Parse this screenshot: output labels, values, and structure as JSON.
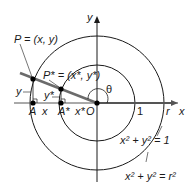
{
  "diagram": {
    "origin": {
      "x": 97,
      "y": 103,
      "label": "O"
    },
    "axes": {
      "x_label": "x",
      "y_label": "y"
    },
    "circles": [
      {
        "name": "unit-circle",
        "radius_px": 38,
        "tick_label": "1",
        "equation": "x² + y² = 1"
      },
      {
        "name": "circle-r",
        "radius_px": 67,
        "tick_label": "r",
        "equation": "x² + y² = r²"
      }
    ],
    "points": {
      "P": {
        "label": "P = (x, y)",
        "x": 33,
        "y": 79
      },
      "P_star": {
        "label": "P* = (x*, y*)",
        "x": 61,
        "y": 89
      },
      "A": {
        "label": "A",
        "x": 33,
        "y": 103
      },
      "A_star": {
        "label": "A*",
        "x": 61,
        "y": 103
      }
    },
    "segment_labels": {
      "y": "y",
      "y_star": "y*",
      "x": "x",
      "x_star": "x*"
    },
    "angle_label": "θ",
    "colors": {
      "line": "#1a1a1a",
      "terminal_side": "#6b6b6b",
      "axis_x": "#555555"
    }
  }
}
